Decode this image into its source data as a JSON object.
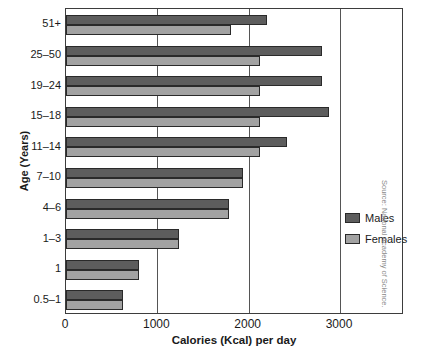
{
  "chart_data": {
    "type": "bar",
    "orientation": "horizontal",
    "title": "",
    "xlabel": "Calories (Kcal) per day",
    "ylabel": "Age (Years)",
    "xlim": [
      0,
      3700
    ],
    "xticks": [
      0,
      1000,
      2000,
      3000
    ],
    "xtick_labels": [
      "0",
      "1000",
      "2000",
      "3000"
    ],
    "grid": true,
    "grid_axis": "x",
    "legend_position": "right-middle",
    "categories": [
      "51+",
      "25–50",
      "19–24",
      "15–18",
      "11–14",
      "7–10",
      "4–6",
      "1–3",
      "1",
      "0.5–1"
    ],
    "series": [
      {
        "name": "Males",
        "color": "#5d5d5d",
        "values": [
          2200,
          2800,
          2800,
          2880,
          2420,
          1940,
          1780,
          1240,
          800,
          620
        ]
      },
      {
        "name": "Females",
        "color": "#a2a2a2",
        "values": [
          1810,
          2120,
          2120,
          2120,
          2120,
          1940,
          1780,
          1240,
          800,
          620
        ]
      }
    ]
  },
  "axes": {
    "y_title": "Age (Years)",
    "x_title": "Calories (Kcal) per day"
  },
  "legend": {
    "items": [
      {
        "label": "Males",
        "color": "#5d5d5d"
      },
      {
        "label": "Females",
        "color": "#a2a2a2"
      }
    ]
  },
  "source": {
    "text": "Source: National Academy of Science."
  }
}
